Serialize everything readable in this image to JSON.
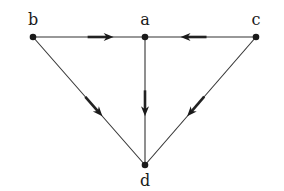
{
  "diagram": {
    "type": "directed-graph",
    "colors": {
      "line": "#333333",
      "node": "#1a1a1a",
      "label": "#1a1a1a",
      "background": "#ffffff"
    },
    "nodes": [
      {
        "id": "b",
        "label": "b",
        "x": 33,
        "y": 37,
        "lx": 33,
        "ly": 25
      },
      {
        "id": "a",
        "label": "a",
        "x": 145,
        "y": 37,
        "lx": 145,
        "ly": 25
      },
      {
        "id": "c",
        "label": "c",
        "x": 256,
        "y": 37,
        "lx": 256,
        "ly": 25
      },
      {
        "id": "d",
        "label": "d",
        "x": 145,
        "y": 165,
        "lx": 145,
        "ly": 186
      }
    ],
    "edges": [
      {
        "from": "b",
        "to": "a",
        "arrow_at": 0.72
      },
      {
        "from": "c",
        "to": "a",
        "arrow_at": 0.68
      },
      {
        "from": "a",
        "to": "d",
        "arrow_at": 0.62
      },
      {
        "from": "b",
        "to": "d",
        "arrow_at": 0.62
      },
      {
        "from": "c",
        "to": "d",
        "arrow_at": 0.62
      }
    ]
  }
}
